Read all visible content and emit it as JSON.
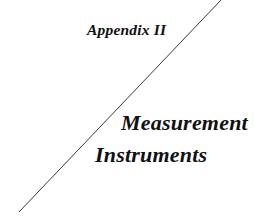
{
  "page": {
    "background_color": "#ffffff",
    "width": 255,
    "height": 223
  },
  "appendix": {
    "label": "Appendix II"
  },
  "subject": {
    "line1": "Measurement",
    "line2": "Instruments"
  },
  "divider": {
    "name": "diagonal-rule",
    "color": "#3a3a3a",
    "thickness": 1,
    "x1": 19,
    "y1": 212,
    "x2": 221,
    "y2": 0
  }
}
